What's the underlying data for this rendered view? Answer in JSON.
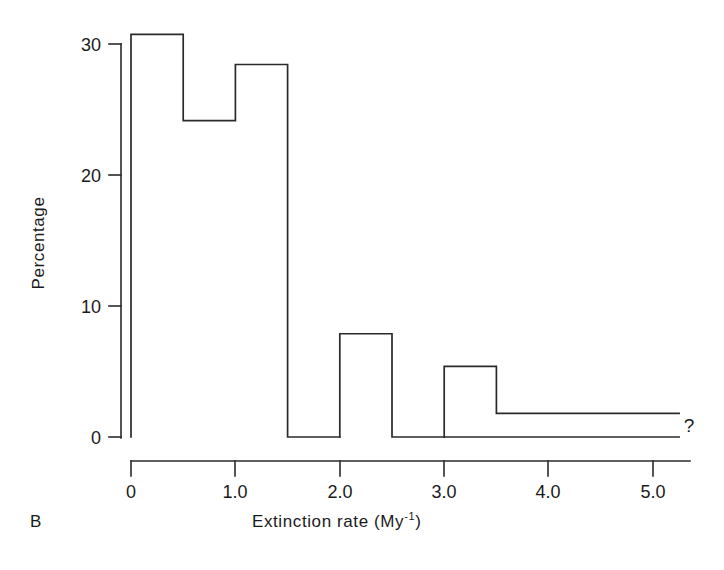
{
  "panel": {
    "label": "B"
  },
  "annotations": {
    "question_mark": "?"
  },
  "axes": {
    "y_label": "Percentage",
    "x_label_main": "Extinction rate (My",
    "x_label_sup": "-1",
    "x_label_close": ")",
    "x_label_full": "Extinction rate (My⁻¹)",
    "y_ticks": [
      "0",
      "10",
      "20",
      "30"
    ],
    "x_ticks": [
      "0",
      "1.0",
      "2.0",
      "3.0",
      "4.0",
      "5.0"
    ]
  },
  "chart_data": {
    "type": "bar",
    "title": "",
    "subtitle": "",
    "xlabel": "Extinction rate (My⁻¹)",
    "ylabel": "Percentage",
    "xlim": [
      0,
      5.35
    ],
    "ylim": [
      0,
      31.5
    ],
    "xticks": [
      0,
      1.0,
      2.0,
      3.0,
      4.0,
      5.0
    ],
    "xticklabels": [
      "0",
      "1.0",
      "2.0",
      "3.0",
      "4.0",
      "5.0"
    ],
    "yticks": [
      0,
      10,
      20,
      30
    ],
    "yticklabels": [
      "0",
      "10",
      "20",
      "30"
    ],
    "grid": false,
    "legend": false,
    "legend_position": "none",
    "bin_width": 0.5,
    "bars": [
      {
        "x0": 0.0,
        "x1": 0.5,
        "value": 30.8
      },
      {
        "x0": 0.5,
        "x1": 1.0,
        "value": 24.2
      },
      {
        "x0": 1.0,
        "x1": 1.5,
        "value": 28.5
      },
      {
        "x0": 1.5,
        "x1": 2.0,
        "value": 0.0
      },
      {
        "x0": 2.0,
        "x1": 2.5,
        "value": 7.9
      },
      {
        "x0": 2.5,
        "x1": 3.0,
        "value": 0.0
      },
      {
        "x0": 3.0,
        "x1": 3.5,
        "value": 5.4
      },
      {
        "x0": 3.5,
        "x1": 5.25,
        "value": 1.8
      }
    ],
    "categories": [
      "0.0-0.5",
      "0.5-1.0",
      "1.0-1.5",
      "1.5-2.0",
      "2.0-2.5",
      "2.5-3.0",
      "3.0-3.5",
      "3.5-5.25"
    ],
    "values": [
      30.8,
      24.2,
      28.5,
      0.0,
      7.9,
      0.0,
      5.4,
      1.8
    ],
    "annotations": [
      {
        "text": "?",
        "x": 5.35,
        "y": 1.8
      }
    ]
  }
}
